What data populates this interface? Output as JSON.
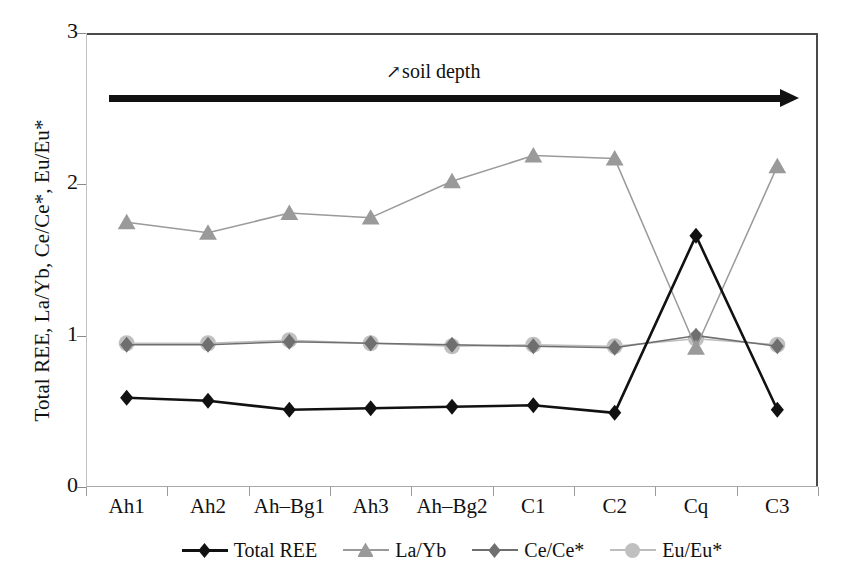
{
  "chart_data": {
    "type": "line",
    "title": "",
    "xlabel": "",
    "ylabel": "Total REE, La/Yb, Ce/Ce*, Eu/Eu*",
    "categories": [
      "Ah1",
      "Ah2",
      "Ah–Bg1",
      "Ah3",
      "Ah–Bg2",
      "C1",
      "C2",
      "Cq",
      "C3"
    ],
    "ylim": [
      0,
      3
    ],
    "yticks": [
      "0",
      "1",
      "2",
      "3"
    ],
    "ytick_values": [
      0,
      1,
      2,
      3
    ],
    "grid": false,
    "legend_position": "bottom",
    "annotations": [
      {
        "name": "soil-depth-arrow",
        "text": "soil depth",
        "arrow_glyph": "↗",
        "direction": "left-to-right",
        "color": "#111111"
      }
    ],
    "series": [
      {
        "name": "Total REE",
        "marker": "diamond",
        "color": "#111111",
        "line_color": "#111111",
        "line_width": 2.6,
        "values": [
          0.59,
          0.57,
          0.51,
          0.52,
          0.53,
          0.54,
          0.49,
          1.66,
          0.51
        ]
      },
      {
        "name": "La/Yb",
        "marker": "triangle",
        "color": "#9a9a9a",
        "line_color": "#9a9a9a",
        "line_width": 1.5,
        "values": [
          1.75,
          1.68,
          1.81,
          1.78,
          2.02,
          2.19,
          2.17,
          0.92,
          2.12
        ]
      },
      {
        "name": "Ce/Ce*",
        "marker": "diamond",
        "color": "#6f6f6f",
        "line_color": "#6f6f6f",
        "line_width": 1.6,
        "values": [
          0.94,
          0.94,
          0.96,
          0.95,
          0.94,
          0.93,
          0.92,
          1.0,
          0.93
        ]
      },
      {
        "name": "Eu/Eu*",
        "marker": "circle",
        "color": "#c0c0c0",
        "line_color": "#bdbdbd",
        "line_width": 1.6,
        "values": [
          0.95,
          0.95,
          0.97,
          0.95,
          0.93,
          0.94,
          0.93,
          0.98,
          0.94
        ]
      }
    ]
  },
  "legend": {
    "items": [
      {
        "label": "Total REE"
      },
      {
        "label": "La/Yb"
      },
      {
        "label": "Ce/Ce*"
      },
      {
        "label": "Eu/Eu*"
      }
    ]
  }
}
